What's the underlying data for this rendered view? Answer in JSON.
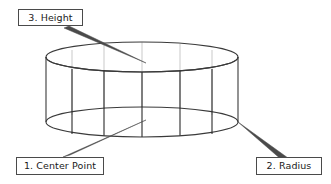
{
  "diagram": {
    "labels": [
      {
        "id": "center-point",
        "text": "1. Center Point"
      },
      {
        "id": "radius",
        "text": "2. Radius"
      },
      {
        "id": "height",
        "text": "3. Height"
      }
    ],
    "colors": {
      "outline": "#3a3a3a",
      "hidden_edge": "#c9c9c9",
      "front_edge": "#2a2a2a",
      "leader": "#4a4a4a",
      "box_border": "#4a4a4a",
      "background": "#ffffff",
      "text": "#1a1a1a"
    },
    "geometry": {
      "top_ellipse": {
        "cx": 142,
        "cy": 57,
        "rx": 96,
        "ry": 15
      },
      "bottom_ellipse": {
        "cx": 142,
        "cy": 122,
        "rx": 96,
        "ry": 15
      },
      "height_px": 65
    }
  },
  "callouts": {
    "height": {
      "label": "3. Height"
    },
    "center_point": {
      "label": "1. Center Point"
    },
    "radius": {
      "label": "2. Radius"
    }
  }
}
